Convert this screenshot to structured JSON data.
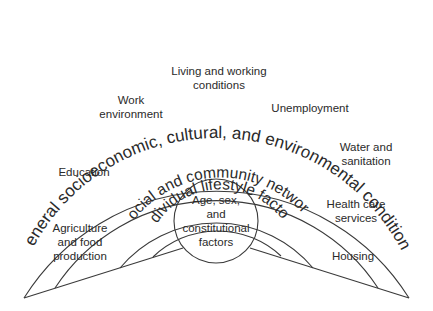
{
  "diagram": {
    "layers": {
      "outer": {
        "label": "General socioeconomic, cultural, and environmental conditions"
      },
      "social": {
        "label": "Social and community networks"
      },
      "individual": {
        "label": "Individual lifestyle factors"
      },
      "core": {
        "lines": [
          "Age, sex,",
          "and",
          "constitutional",
          "factors"
        ]
      }
    },
    "factors": {
      "living_working": {
        "lines": [
          "Living and working",
          "conditions"
        ]
      },
      "work_environment": {
        "lines": [
          "Work",
          "environment"
        ]
      },
      "unemployment": {
        "lines": [
          "Unemployment"
        ]
      },
      "education": {
        "lines": [
          "Education"
        ]
      },
      "water_sanitation": {
        "lines": [
          "Water and",
          "sanitation"
        ]
      },
      "agriculture": {
        "lines": [
          "Agriculture",
          "and food",
          "production"
        ]
      },
      "health_care": {
        "lines": [
          "Health care",
          "services"
        ]
      },
      "housing": {
        "lines": [
          "Housing"
        ]
      }
    },
    "colors": {
      "line": "#3a3a3a",
      "text": "#2a2a2a",
      "background": "#ffffff"
    }
  }
}
